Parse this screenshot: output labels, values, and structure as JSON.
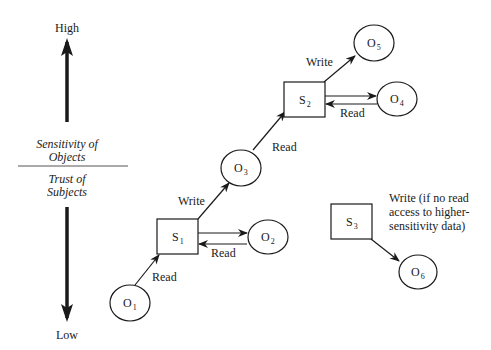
{
  "axis": {
    "high_label": "High",
    "low_label": "Low",
    "upper_caption_line1": "Sensitivity of",
    "upper_caption_line2": "Objects",
    "lower_caption_line1": "Trust of",
    "lower_caption_line2": "Subjects"
  },
  "subjects": [
    {
      "id": "S1",
      "letter": "S",
      "index": "1"
    },
    {
      "id": "S2",
      "letter": "S",
      "index": "2"
    },
    {
      "id": "S3",
      "letter": "S",
      "index": "3"
    }
  ],
  "objects": [
    {
      "id": "O1",
      "letter": "O",
      "index": "1"
    },
    {
      "id": "O2",
      "letter": "O",
      "index": "2"
    },
    {
      "id": "O3",
      "letter": "O",
      "index": "3"
    },
    {
      "id": "O4",
      "letter": "O",
      "index": "4"
    },
    {
      "id": "O5",
      "letter": "O",
      "index": "5"
    },
    {
      "id": "O6",
      "letter": "O",
      "index": "6"
    }
  ],
  "edges": [
    {
      "from": "O1",
      "to": "S1",
      "label": "Read"
    },
    {
      "from": "S1",
      "to": "O2",
      "label": ""
    },
    {
      "from": "O2",
      "to": "S1",
      "label": "Read"
    },
    {
      "from": "S1",
      "to": "O3",
      "label": "Write"
    },
    {
      "from": "O3",
      "to": "S2",
      "label": "Read"
    },
    {
      "from": "S2",
      "to": "O4",
      "label": ""
    },
    {
      "from": "O4",
      "to": "S2",
      "label": "Read"
    },
    {
      "from": "S2",
      "to": "O5",
      "label": "Write"
    },
    {
      "from": "S3",
      "to": "O6",
      "label": ""
    }
  ],
  "labels": {
    "o1_s1": "Read",
    "o2_s1": "Read",
    "s1_o3": "Write",
    "o3_s2": "Read",
    "o4_s2": "Read",
    "s2_o5": "Write",
    "s3_note_line1": "Write (if no read",
    "s3_note_line2": "access to higher-",
    "s3_note_line3": "sensitivity data)"
  }
}
